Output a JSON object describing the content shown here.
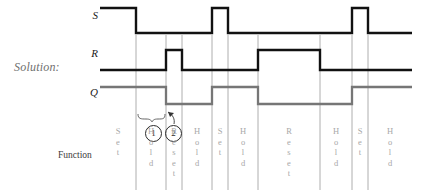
{
  "title_text": "Solution:",
  "signals": {
    "s_label": "S",
    "r_label": "R",
    "q_label": "Q"
  },
  "function_row_label": "Function",
  "annotations": [
    {
      "name": "marker-1",
      "text": "1"
    },
    {
      "name": "marker-2",
      "text": "2"
    }
  ],
  "colors": {
    "s_trace": "#111111",
    "r_trace": "#111111",
    "q_trace": "#767676",
    "gridline": "#9a9a9a",
    "function_text": "#a8a8a8",
    "solution_text": "#6f6f6f"
  },
  "function_columns": [
    {
      "label": "Set",
      "letters": [
        "S",
        "e",
        "t"
      ]
    },
    {
      "label": "Hold",
      "letters": [
        "H",
        "o",
        "l",
        "d"
      ]
    },
    {
      "label": "Reset",
      "letters": [
        "R",
        "e",
        "s",
        "e",
        "t"
      ]
    },
    {
      "label": "Hold",
      "letters": [
        "H",
        "o",
        "l",
        "d"
      ]
    },
    {
      "label": "Set",
      "letters": [
        "S",
        "e",
        "t"
      ]
    },
    {
      "label": "Hold",
      "letters": [
        "H",
        "o",
        "l",
        "d"
      ]
    },
    {
      "label": "Reset",
      "letters": [
        "R",
        "e",
        "s",
        "e",
        "t"
      ]
    },
    {
      "label": "Hold",
      "letters": [
        "H",
        "o",
        "l",
        "d"
      ]
    },
    {
      "label": "Set",
      "letters": [
        "S",
        "e",
        "t"
      ]
    },
    {
      "label": "Hold",
      "letters": [
        "H",
        "o",
        "l",
        "d"
      ]
    }
  ],
  "chart_data": {
    "type": "line",
    "title": "Solution:",
    "xlabel": "Function",
    "ylabel": "",
    "grid": true,
    "legend_position": "left-axis-labels",
    "xlim": [
      100,
      412
    ],
    "gridlines_x": [
      136,
      166,
      182,
      212,
      228,
      258,
      320,
      352,
      368
    ],
    "levels": {
      "S_high_y": 8,
      "S_low_y": 33,
      "R_high_y": 50,
      "R_low_y": 70,
      "Q_high_y": 87,
      "Q_low_y": 104
    },
    "series": [
      {
        "name": "S",
        "color": "#111111",
        "points": [
          [
            100,
            1
          ],
          [
            136,
            1
          ],
          [
            136,
            0
          ],
          [
            212,
            0
          ],
          [
            212,
            1
          ],
          [
            228,
            1
          ],
          [
            228,
            0
          ],
          [
            352,
            0
          ],
          [
            352,
            1
          ],
          [
            368,
            1
          ],
          [
            368,
            0
          ],
          [
            412,
            0
          ]
        ]
      },
      {
        "name": "R",
        "color": "#111111",
        "points": [
          [
            100,
            0
          ],
          [
            166,
            0
          ],
          [
            166,
            1
          ],
          [
            182,
            1
          ],
          [
            182,
            0
          ],
          [
            258,
            0
          ],
          [
            258,
            1
          ],
          [
            320,
            1
          ],
          [
            320,
            0
          ],
          [
            412,
            0
          ]
        ]
      },
      {
        "name": "Q",
        "color": "#767676",
        "points": [
          [
            100,
            1
          ],
          [
            166,
            1
          ],
          [
            166,
            0
          ],
          [
            212,
            0
          ],
          [
            212,
            1
          ],
          [
            258,
            1
          ],
          [
            258,
            0
          ],
          [
            352,
            0
          ],
          [
            352,
            1
          ],
          [
            412,
            1
          ]
        ]
      }
    ],
    "function_sequence": [
      "Set",
      "Hold",
      "Reset",
      "Hold",
      "Set",
      "Hold",
      "Reset",
      "Hold",
      "Set",
      "Hold"
    ],
    "annotations": [
      {
        "text": "1",
        "kind": "circled-number",
        "x": 152,
        "y": 132,
        "note": "brace spanning Hold interval"
      },
      {
        "text": "2",
        "kind": "circled-number",
        "x": 172,
        "y": 132,
        "note": "arrow to Q falling edge"
      }
    ]
  }
}
